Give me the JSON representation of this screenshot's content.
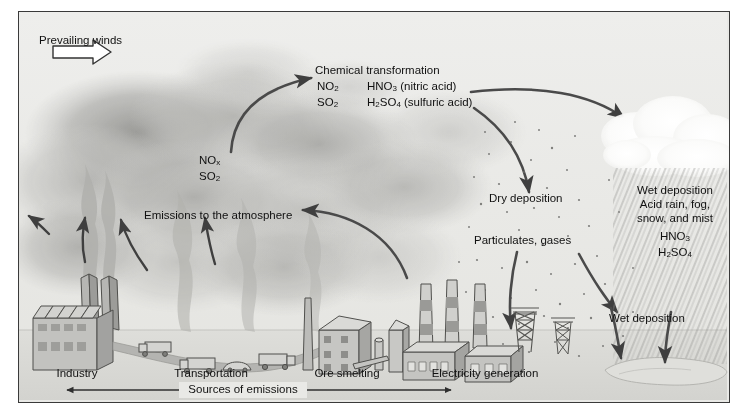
{
  "figure": {
    "frame_bg": "#e9e9e6",
    "ink": "#333333"
  },
  "labels": {
    "prevailing_winds": "Prevailing winds",
    "emissions_atmosphere": "Emissions to the atmosphere",
    "chemical_transformation": "Chemical transformation",
    "dry_deposition": "Dry deposition",
    "particulates_gases": "Particulates, gases",
    "wet_deposition_short": "Wet deposition",
    "sources_of_emissions": "Sources of emissions"
  },
  "plume_species": [
    {
      "formula": "NO",
      "sub": "x"
    },
    {
      "formula": "SO",
      "sub": "2"
    }
  ],
  "transformation": {
    "reactants": [
      {
        "formula": "NO",
        "sub": "2"
      },
      {
        "formula": "SO",
        "sub": "2"
      }
    ],
    "products": [
      {
        "pre": "HNO",
        "sub": "3",
        "post": " (nitric acid)"
      },
      {
        "pre": "H",
        "sub": "2",
        "mid": "SO",
        "sub2": "4",
        "post": " (sulfuric acid)"
      }
    ]
  },
  "wet_deposition_box": {
    "line1": "Wet deposition",
    "line2": "Acid rain, fog,",
    "line3": "snow, and mist",
    "acid1": {
      "pre": "HNO",
      "sub": "3"
    },
    "acid2": {
      "pre": "H",
      "sub": "2",
      "mid": "SO",
      "sub2": "4"
    }
  },
  "sources": [
    {
      "id": "industry",
      "label": "Industry"
    },
    {
      "id": "transportation",
      "label": "Transportation"
    },
    {
      "id": "ore-smelting",
      "label": "Ore smelting"
    },
    {
      "id": "electricity-generation",
      "label": "Electricity generation"
    }
  ],
  "colors": {
    "smoke_dark": "#9a9a97",
    "smoke_light": "#c7c7c4",
    "cloud": "#fdfdfd",
    "arrow": "#4a4a4a",
    "building": "#b9b9b6",
    "ground": "#dcdcd8"
  }
}
